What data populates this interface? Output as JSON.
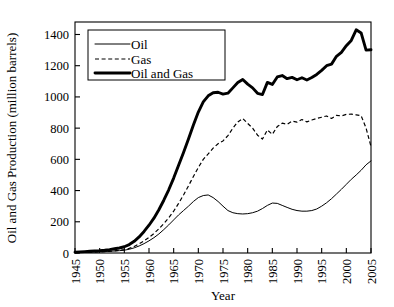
{
  "chart_data": {
    "type": "line",
    "title": "",
    "xlabel": "Year",
    "ylabel": "Oil and Gas Production (million barrels)",
    "xlim": [
      1945,
      2005
    ],
    "ylim": [
      0,
      1480
    ],
    "yticks": [
      0,
      200,
      400,
      600,
      800,
      1000,
      1200,
      1400
    ],
    "ytick_labels": [
      "0",
      "200",
      "400",
      "600",
      "800",
      "1000",
      "1200",
      "1400"
    ],
    "xticks": [
      1945,
      1950,
      1955,
      1960,
      1965,
      1970,
      1975,
      1980,
      1985,
      1990,
      1995,
      2000,
      2005
    ],
    "xtick_labels": [
      "1945",
      "1950",
      "1955",
      "1960",
      "1965",
      "1970",
      "1975",
      "1980",
      "1985",
      "1990",
      "1995",
      "2000",
      "2005"
    ],
    "grid": false,
    "legend_position": "upper-left",
    "x": [
      1945,
      1946,
      1947,
      1948,
      1949,
      1950,
      1951,
      1952,
      1953,
      1954,
      1955,
      1956,
      1957,
      1958,
      1959,
      1960,
      1961,
      1962,
      1963,
      1964,
      1965,
      1966,
      1967,
      1968,
      1969,
      1970,
      1971,
      1972,
      1973,
      1974,
      1975,
      1976,
      1977,
      1978,
      1979,
      1980,
      1981,
      1982,
      1983,
      1984,
      1985,
      1986,
      1987,
      1988,
      1989,
      1990,
      1991,
      1992,
      1993,
      1994,
      1995,
      1996,
      1997,
      1998,
      1999,
      2000,
      2001,
      2002,
      2003,
      2004,
      2005
    ],
    "series": [
      {
        "name": "Oil",
        "style": "thin-solid",
        "values": [
          3,
          4,
          5,
          6,
          7,
          8,
          9,
          11,
          13,
          15,
          18,
          24,
          33,
          45,
          60,
          78,
          98,
          122,
          150,
          180,
          212,
          244,
          272,
          300,
          330,
          355,
          368,
          372,
          355,
          330,
          300,
          272,
          258,
          252,
          250,
          252,
          258,
          268,
          285,
          305,
          320,
          318,
          305,
          292,
          280,
          272,
          268,
          268,
          272,
          282,
          300,
          322,
          348,
          378,
          408,
          440,
          472,
          500,
          530,
          565,
          590
        ]
      },
      {
        "name": "Gas",
        "style": "dashed",
        "values": [
          2,
          3,
          4,
          5,
          6,
          7,
          9,
          11,
          14,
          17,
          22,
          30,
          42,
          58,
          78,
          100,
          125,
          155,
          188,
          225,
          268,
          318,
          372,
          430,
          490,
          548,
          600,
          635,
          672,
          700,
          718,
          752,
          800,
          840,
          862,
          830,
          800,
          755,
          730,
          788,
          760,
          810,
          832,
          825,
          845,
          838,
          855,
          840,
          852,
          862,
          870,
          878,
          862,
          882,
          878,
          888,
          890,
          885,
          880,
          800,
          682
        ]
      },
      {
        "name": "Oil and Gas",
        "style": "thick-solid",
        "values": [
          5,
          7,
          9,
          11,
          13,
          15,
          18,
          22,
          27,
          32,
          40,
          54,
          75,
          103,
          138,
          178,
          223,
          277,
          338,
          405,
          480,
          562,
          644,
          730,
          820,
          903,
          968,
          1007,
          1027,
          1030,
          1018,
          1024,
          1058,
          1092,
          1112,
          1082,
          1058,
          1023,
          1015,
          1093,
          1080,
          1128,
          1137,
          1117,
          1125,
          1110,
          1123,
          1108,
          1124,
          1144,
          1170,
          1200,
          1210,
          1260,
          1286,
          1328,
          1362,
          1430,
          1410,
          1300,
          1302
        ]
      }
    ],
    "legend": [
      {
        "label": "Oil",
        "style": "thin-solid"
      },
      {
        "label": "Gas",
        "style": "dashed"
      },
      {
        "label": "Oil and Gas",
        "style": "thick-solid"
      }
    ]
  }
}
